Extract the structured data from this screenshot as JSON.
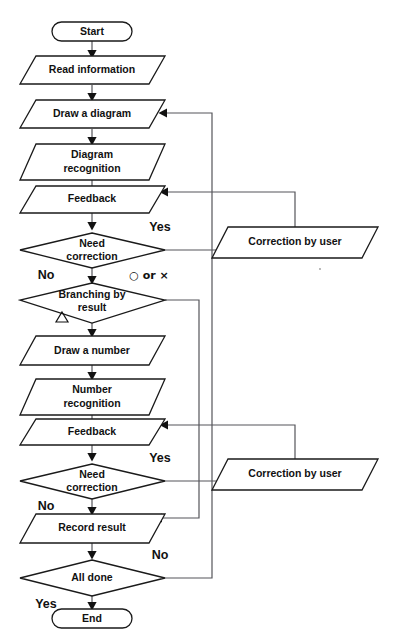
{
  "diagram": {
    "orientation": "top-to-bottom",
    "stroke_color": "#1a1a1a",
    "connector_color": "#55555a",
    "background": "#ffffff"
  },
  "nodes": [
    {
      "id": "start",
      "label": "Start",
      "shape": "terminator"
    },
    {
      "id": "read_info",
      "label": "Read information",
      "shape": "parallelogram"
    },
    {
      "id": "draw_diagram",
      "label": "Draw a diagram",
      "shape": "parallelogram"
    },
    {
      "id": "diag_recog_1",
      "label": "Diagram",
      "shape": "parallelogram"
    },
    {
      "id": "diag_recog_2",
      "label": "recognition",
      "shape": "parallelogram-line2"
    },
    {
      "id": "feedback_1",
      "label": "Feedback",
      "shape": "parallelogram"
    },
    {
      "id": "need_corr_1a",
      "label": "Need",
      "shape": "diamond"
    },
    {
      "id": "need_corr_1b",
      "label": "correction",
      "shape": "diamond-line2"
    },
    {
      "id": "correction_1",
      "label": "Correction by user",
      "shape": "parallelogram"
    },
    {
      "id": "branch_1",
      "label": "Branching by",
      "shape": "diamond"
    },
    {
      "id": "branch_2",
      "label": "result",
      "shape": "diamond-line2"
    },
    {
      "id": "draw_number",
      "label": "Draw a number",
      "shape": "parallelogram"
    },
    {
      "id": "num_recog_1",
      "label": "Number",
      "shape": "parallelogram"
    },
    {
      "id": "num_recog_2",
      "label": "recognition",
      "shape": "parallelogram-line2"
    },
    {
      "id": "feedback_2",
      "label": "Feedback",
      "shape": "parallelogram"
    },
    {
      "id": "need_corr_2a",
      "label": "Need",
      "shape": "diamond"
    },
    {
      "id": "need_corr_2b",
      "label": "correction",
      "shape": "diamond-line2"
    },
    {
      "id": "correction_2",
      "label": "Correction by user",
      "shape": "parallelogram"
    },
    {
      "id": "record_result",
      "label": "Record result",
      "shape": "parallelogram"
    },
    {
      "id": "all_done",
      "label": "All done",
      "shape": "diamond"
    },
    {
      "id": "end",
      "label": "End",
      "shape": "terminator"
    }
  ],
  "edge_labels": {
    "need_correction_1_yes": "Yes",
    "need_correction_1_no": "No",
    "branching_circle_or_cross": "○ or ×",
    "branching_triangle": "△",
    "need_correction_2_yes": "Yes",
    "need_correction_2_no": "No",
    "all_done_no": "No",
    "all_done_yes": "Yes"
  }
}
